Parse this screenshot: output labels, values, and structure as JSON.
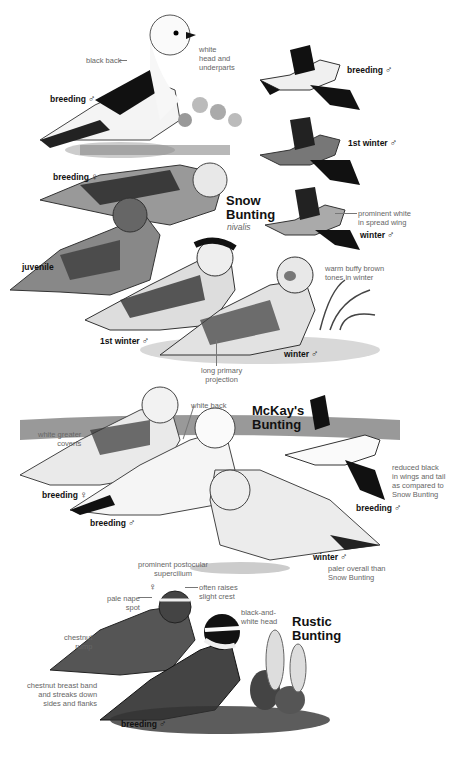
{
  "plate": {
    "species": [
      {
        "name_line1": "Snow",
        "name_line2": "Bunting",
        "subspecies": "nivalis",
        "figures": [
          {
            "label": "breeding",
            "sex": "♂",
            "pose": "perched"
          },
          {
            "label": "breeding",
            "sex": "♂",
            "pose": "flight"
          },
          {
            "label": "1st winter",
            "sex": "♂",
            "pose": "flight"
          },
          {
            "label": "winter",
            "sex": "♂",
            "pose": "flight"
          },
          {
            "label": "breeding",
            "sex": "♀",
            "pose": "perched"
          },
          {
            "label": "juvenile",
            "sex": "",
            "pose": "perched"
          },
          {
            "label": "1st winter",
            "sex": "♂",
            "pose": "perched"
          },
          {
            "label": "winter",
            "sex": "♂",
            "pose": "perched"
          }
        ],
        "annotations": [
          "black back",
          "white\nhead and\nunderparts",
          "prominent white\nin spread wing",
          "warm buffy brown\ntones in winter",
          "long primary\nprojection"
        ]
      },
      {
        "name_line1": "McKay's",
        "name_line2": "Bunting",
        "figures": [
          {
            "label": "breeding",
            "sex": "♀",
            "pose": "perched"
          },
          {
            "label": "breeding",
            "sex": "♂",
            "pose": "perched"
          },
          {
            "label": "breeding",
            "sex": "♂",
            "pose": "flight"
          },
          {
            "label": "winter",
            "sex": "♂",
            "pose": "perched"
          }
        ],
        "annotations": [
          "white greater\ncoverts",
          "white back",
          "reduced black\nin wings and tail\nas compared to\nSnow Bunting",
          "paler overall than\nSnow Bunting"
        ]
      },
      {
        "name_line1": "Rustic",
        "name_line2": "Bunting",
        "figures": [
          {
            "label": "",
            "sex": "♀",
            "pose": "perched"
          },
          {
            "label": "breeding",
            "sex": "♂",
            "pose": "perched"
          }
        ],
        "annotations": [
          "prominent postocular\nsupercilium",
          "often raises\nslight crest",
          "pale nape\nspot",
          "black-and-\nwhite head",
          "chestnut\nrump",
          "chestnut breast band\nand streaks down\nsides and flanks"
        ]
      }
    ]
  }
}
